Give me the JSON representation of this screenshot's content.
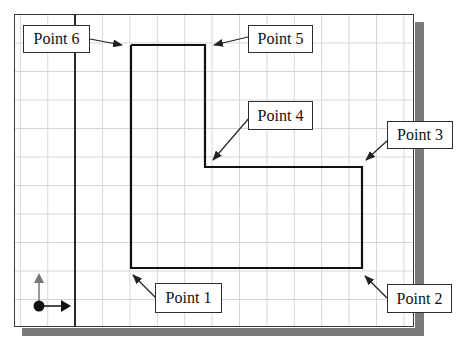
{
  "diagram": {
    "type": "cad-outline-l-shape",
    "colors": {
      "line": "#111111",
      "grid": "#d6d6d6",
      "shadow": "#7a7a7a",
      "ucs_y_arrow": "#777777"
    },
    "points": [
      {
        "id": 1,
        "label": "Point 1",
        "x": 131,
        "y": 268
      },
      {
        "id": 2,
        "label": "Point 2",
        "x": 362,
        "y": 268
      },
      {
        "id": 3,
        "label": "Point 3",
        "x": 362,
        "y": 167
      },
      {
        "id": 4,
        "label": "Point 4",
        "x": 205,
        "y": 167
      },
      {
        "id": 5,
        "label": "Point 5",
        "x": 205,
        "y": 45
      },
      {
        "id": 6,
        "label": "Point 6",
        "x": 131,
        "y": 45
      }
    ],
    "labels": {
      "p1": "Point 1",
      "p2": "Point 2",
      "p3": "Point 3",
      "p4": "Point 4",
      "p5": "Point 5",
      "p6": "Point 6"
    },
    "ucs_icon": "ucs-axes-icon"
  }
}
